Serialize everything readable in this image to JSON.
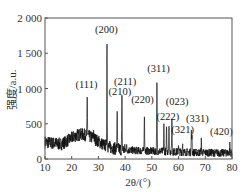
{
  "chart_data": {
    "type": "line",
    "title": "",
    "xlabel": "2θ/(°)",
    "ylabel": "强度/a.u.",
    "xlim": [
      10,
      80
    ],
    "ylim": [
      0,
      2000
    ],
    "x_ticks": [
      10,
      20,
      30,
      40,
      50,
      60,
      70,
      80
    ],
    "x_tick_labels": [
      "10",
      "20",
      "30",
      "40",
      "50",
      "60",
      "70",
      "80"
    ],
    "y_ticks": [
      0,
      500,
      1000,
      1500,
      2000
    ],
    "y_tick_labels": [
      "0",
      "500",
      "1 000",
      "1 500",
      "2 000"
    ],
    "grid": false,
    "legend": null,
    "background_profile": {
      "x": [
        10,
        12,
        14,
        16,
        18,
        20,
        22,
        24,
        26,
        28,
        30,
        32,
        34,
        36,
        38,
        40,
        44,
        48,
        52,
        56,
        60,
        64,
        68,
        72,
        76,
        80
      ],
      "y": [
        240,
        230,
        220,
        210,
        250,
        300,
        340,
        350,
        330,
        300,
        250,
        200,
        170,
        150,
        140,
        130,
        120,
        115,
        110,
        105,
        100,
        95,
        90,
        90,
        85,
        90
      ]
    },
    "peaks": [
      {
        "label": "(111)",
        "x": 25.8,
        "y": 880
      },
      {
        "label": "(200)",
        "x": 33.2,
        "y": 1660
      },
      {
        "label": "(210)",
        "x": 37.0,
        "y": 720
      },
      {
        "label": "(211)",
        "x": 38.8,
        "y": 840
      },
      {
        "label": "(220)",
        "x": 47.2,
        "y": 650
      },
      {
        "label": "(311)",
        "x": 51.9,
        "y": 1090
      },
      {
        "label": "(222)",
        "x": 54.5,
        "y": 480
      },
      {
        "label": "(023)",
        "x": 57.5,
        "y": 560
      },
      {
        "label": "(321)",
        "x": 61.5,
        "y": 230
      },
      {
        "label": "(331)",
        "x": 64.8,
        "y": 400
      },
      {
        "label": "(420)",
        "x": 68.5,
        "y": 260
      }
    ],
    "peak_label_positions": [
      {
        "label": "(111)",
        "x": 25.5,
        "y": 1010
      },
      {
        "label": "(200)",
        "x": 33.0,
        "y": 1790
      },
      {
        "label": "(210)",
        "x": 38.0,
        "y": 910
      },
      {
        "label": "(211)",
        "x": 40.0,
        "y": 1050
      },
      {
        "label": "(220)",
        "x": 46.5,
        "y": 800
      },
      {
        "label": "(311)",
        "x": 52.5,
        "y": 1230
      },
      {
        "label": "(222)",
        "x": 56.0,
        "y": 560
      },
      {
        "label": "(023)",
        "x": 59.5,
        "y": 760
      },
      {
        "label": "(321)",
        "x": 61.5,
        "y": 370
      },
      {
        "label": "(331)",
        "x": 67.0,
        "y": 520
      },
      {
        "label": "(420)",
        "x": 76.0,
        "y": 340
      }
    ],
    "line_color": "#111111"
  }
}
